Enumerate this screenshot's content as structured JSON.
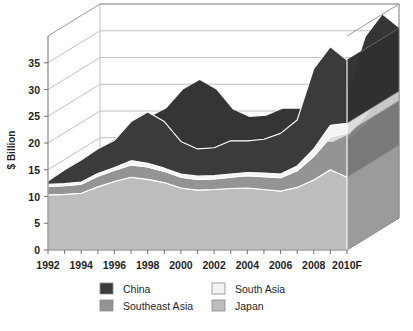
{
  "chart_data": {
    "type": "area",
    "title": "",
    "subtitle": "",
    "xlabel": "",
    "ylabel": "$ Billion",
    "stacked": true,
    "three_d": true,
    "grid": true,
    "legend_position": "bottom",
    "ylim": [
      0,
      40
    ],
    "yticks": [
      0,
      5,
      10,
      15,
      20,
      25,
      30,
      35
    ],
    "x": [
      "1992",
      "1993",
      "1994",
      "1995",
      "1996",
      "1997",
      "1998",
      "1999",
      "2000",
      "2001",
      "2002",
      "2003",
      "2004",
      "2005",
      "2006",
      "2007",
      "2008",
      "2009",
      "2010F"
    ],
    "xtick_labels": [
      "1992",
      "1994",
      "1996",
      "1998",
      "2000",
      "2002",
      "2004",
      "2006",
      "2008",
      "2010F"
    ],
    "xtick_values": [
      "1992",
      "1994",
      "1996",
      "1998",
      "2000",
      "2002",
      "2004",
      "2006",
      "2008",
      "2010F"
    ],
    "series": [
      {
        "name": "Japan",
        "color": "#bdbdbd",
        "values": [
          10.3,
          10.4,
          10.6,
          11.8,
          12.8,
          13.6,
          13.2,
          12.6,
          11.6,
          11.2,
          11.3,
          11.5,
          11.6,
          11.3,
          11.0,
          11.7,
          13.1,
          15.0,
          13.6
        ]
      },
      {
        "name": "Southeast Asia",
        "color": "#949494",
        "values": [
          1.6,
          1.6,
          1.7,
          2.0,
          2.1,
          2.3,
          2.3,
          2.1,
          2.0,
          2.0,
          2.0,
          2.1,
          2.3,
          2.4,
          2.5,
          3.1,
          4.4,
          6.1,
          8.3
        ]
      },
      {
        "name": "South Asia",
        "color": "#f4f4f4",
        "values": [
          0.4,
          0.4,
          0.4,
          0.5,
          0.5,
          0.8,
          0.7,
          0.6,
          0.6,
          0.6,
          0.6,
          0.6,
          0.6,
          0.7,
          0.7,
          0.9,
          1.4,
          2.2,
          1.8
        ]
      },
      {
        "name": "China",
        "color": "#3b3b3b",
        "values": [
          0.6,
          2.6,
          4.1,
          4.6,
          5.1,
          7.3,
          9.6,
          8.7,
          6.1,
          5.1,
          5.2,
          6.2,
          5.9,
          6.3,
          7.6,
          8.6,
          15.0,
          14.7,
          11.8
        ]
      }
    ],
    "totals": [
      12.9,
      15.0,
      16.8,
      18.9,
      20.5,
      24.0,
      25.8,
      24.0,
      20.3,
      18.9,
      19.1,
      20.4,
      20.4,
      20.7,
      21.8,
      24.3,
      33.9,
      38.0,
      35.5
    ],
    "legend": [
      {
        "label": "China",
        "color": "#3b3b3b"
      },
      {
        "label": "South Asia",
        "color": "#f4f4f4"
      },
      {
        "label": "Southeast Asia",
        "color": "#949494"
      },
      {
        "label": "Japan",
        "color": "#bdbdbd"
      }
    ]
  },
  "axis": {
    "y_label": "$ Billion",
    "y_ticks": [
      "0",
      "5",
      "10",
      "15",
      "20",
      "25",
      "30",
      "35"
    ],
    "x_ticks": [
      "1992",
      "1994",
      "1996",
      "1998",
      "2000",
      "2002",
      "2004",
      "2006",
      "2008",
      "2010F"
    ]
  },
  "legend": {
    "china_label": "China",
    "south_asia_label": "South Asia",
    "southeast_asia_label": "Southeast Asia",
    "japan_label": "Japan"
  },
  "colors": {
    "china": "#3b3b3b",
    "southeast_asia": "#949494",
    "south_asia": "#f4f4f4",
    "japan": "#bdbdbd",
    "grid": "#b9b9b9",
    "axis": "#7a7a7a",
    "background": "#ffffff"
  }
}
